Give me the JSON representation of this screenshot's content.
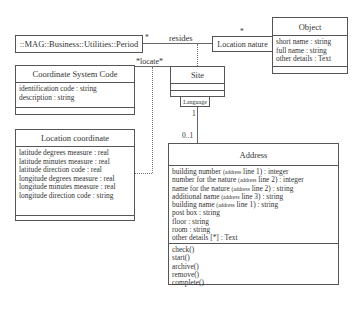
{
  "classes": {
    "period": {
      "name": "::MAG::Business::Utilities::Period"
    },
    "coordinate_system_code": {
      "name": "Coordinate System Code",
      "attributes": [
        "identification code : string",
        "description : string"
      ]
    },
    "location_coordinate": {
      "name": "Location coordinate",
      "attributes": [
        "latitude degrees measure : real",
        "latitude minutes measure : real",
        "latitude direction code : real",
        "longitude degrees measure : real",
        "longitude minutes measure : real",
        "longitude direction code : string"
      ]
    },
    "site": {
      "name": "Site"
    },
    "language": {
      "name": "Language"
    },
    "location_nature": {
      "name": "Location nature"
    },
    "object": {
      "name": "Object",
      "attributes": [
        "short name : string",
        "full name : string",
        "other details : Text"
      ]
    },
    "address": {
      "name": "Address",
      "attributes": [
        {
          "pre": "building number ",
          "small": "(address",
          "post": " line 1) : integer"
        },
        {
          "pre": "number for the nature ",
          "small": "(address",
          "post": " line 2) : integer"
        },
        {
          "pre": "name for the nature ",
          "small": "(address",
          "post": " line 2) : string"
        },
        {
          "pre": "additional name ",
          "small": "(address",
          "post": " line 3) : string"
        },
        {
          "pre": "building name ",
          "small": "(address",
          "post": " line 1) : string"
        },
        {
          "pre": "post box : string",
          "small": "",
          "post": ""
        },
        {
          "pre": "floor : string",
          "small": "",
          "post": ""
        },
        {
          "pre": "room : string",
          "small": "",
          "post": ""
        },
        {
          "pre": "other details [*] : Text",
          "small": "",
          "post": ""
        }
      ],
      "operations": [
        "check()",
        "start()",
        "archive()",
        "remove()",
        "complete()"
      ]
    }
  },
  "associations": {
    "resides": {
      "label": "resides",
      "mult_period": "*",
      "mult_location_nature": "*"
    },
    "locate": {
      "label": "*locate*"
    },
    "site_address": {
      "mult_site": "1",
      "mult_address": "0..1"
    }
  }
}
